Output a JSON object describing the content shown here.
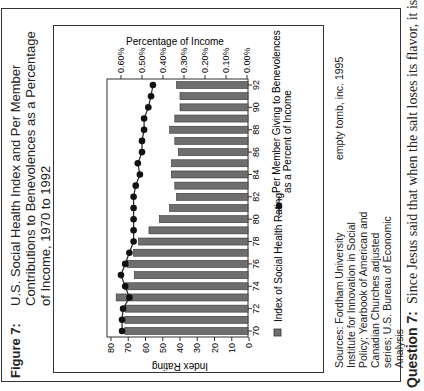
{
  "figure": {
    "label": "Figure 7:",
    "title": "U.S. Social Health Index and Per Member Contributions to Benevolences as a Percentage of Income, 1970 to 1992"
  },
  "sources": {
    "label": "Sources:",
    "text": "Fordham University Institute for Innovation in Social Policy; Yearbook of American and Canadian Churches adjusted series; U.S. Bureau of Economic Analysis"
  },
  "credit": "empty tomb, inc. 1995",
  "question": {
    "label": "Question 7:",
    "text": "Since Jesus said that when the salt loses its flavor, it is not"
  },
  "colors": {
    "bar": "#6e6e6e",
    "bar_edge": "#333333",
    "line": "#222222",
    "marker": "#111111",
    "frame": "#333333"
  },
  "chart_data": {
    "type": "bar",
    "orientation": "rotated 90 degrees counter-clockwise (years run bottom-to-top, values grow leftward)",
    "title": "U.S. Social Health Index and Per Member Contributions to Benevolences as a Percentage of Income, 1970 to 1992",
    "categories": [
      1970,
      1971,
      1972,
      1973,
      1974,
      1975,
      1976,
      1977,
      1978,
      1979,
      1980,
      1981,
      1982,
      1983,
      1984,
      1985,
      1986,
      1987,
      1988,
      1989,
      1990,
      1991,
      1992
    ],
    "category_tick_labels": [
      "70",
      "72",
      "74",
      "76",
      "78",
      "80",
      "82",
      "84",
      "86",
      "88",
      "90",
      "92"
    ],
    "series": [
      {
        "name": "Index of Social Health Rating",
        "type": "bar",
        "axis": "primary",
        "values": [
          72,
          72,
          71.5,
          77,
          72,
          66.5,
          70.5,
          67,
          64,
          58,
          52,
          46,
          42,
          43,
          45,
          45,
          41,
          43,
          46,
          43,
          40,
          40,
          42
        ]
      },
      {
        "name": "Per Member Giving to Benevolences as a Percent of Income",
        "type": "line",
        "marker": "circle",
        "axis": "secondary",
        "values": [
          0.595,
          0.595,
          0.59,
          0.56,
          0.58,
          0.6,
          0.58,
          0.56,
          0.54,
          0.54,
          0.54,
          0.54,
          0.54,
          0.53,
          0.51,
          0.52,
          0.5,
          0.5,
          0.49,
          0.49,
          0.47,
          0.457,
          0.448
        ]
      }
    ],
    "primary_axis": {
      "label": "Index Rating",
      "range": [
        0,
        80
      ],
      "ticks": [
        "80",
        "70",
        "60",
        "50",
        "40",
        "30",
        "20",
        "10",
        "0"
      ]
    },
    "secondary_axis": {
      "label": "Percentage of Income",
      "range": [
        0,
        0.6
      ],
      "ticks": [
        "0.60%",
        "0.50%",
        "0.40%",
        "0.30%",
        "0.20%",
        "0.10%",
        "0.00%"
      ]
    },
    "xlabel": "",
    "grid": false,
    "legend": {
      "position": "below plot (right side when rotated)",
      "entries": [
        "Index of Social Health Rating",
        "Per Member Giving to Benevolences as a Percent of Income"
      ]
    }
  }
}
